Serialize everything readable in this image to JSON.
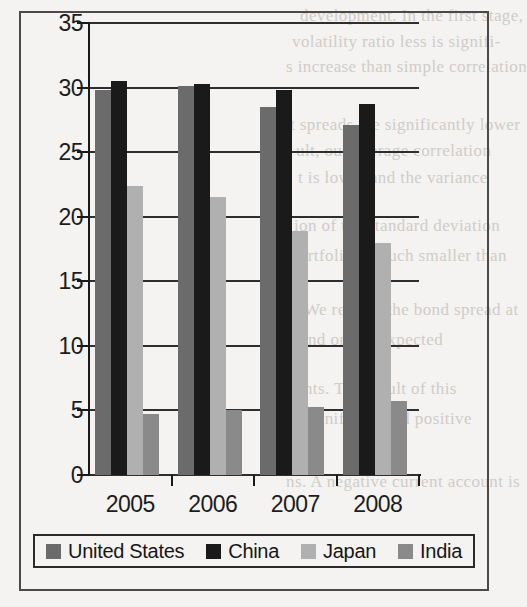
{
  "chart_data": {
    "type": "bar",
    "title": "",
    "subtitle": "",
    "xlabel": "",
    "ylabel": "",
    "categories": [
      "2005",
      "2006",
      "2007",
      "2008"
    ],
    "series": [
      {
        "name": "United States",
        "color": "#6b6b6b",
        "values": [
          29.8,
          30.1,
          28.5,
          27.1
        ]
      },
      {
        "name": "China",
        "color": "#1a1a1a",
        "values": [
          30.5,
          30.3,
          29.8,
          28.7
        ]
      },
      {
        "name": "Japan",
        "color": "#b0b0b0",
        "values": [
          22.4,
          21.5,
          18.9,
          18.0
        ]
      },
      {
        "name": "India",
        "color": "#8a8a8a",
        "values": [
          4.7,
          5.0,
          5.3,
          5.7
        ]
      }
    ],
    "ylim": [
      0,
      35
    ],
    "yticks": [
      0,
      5,
      10,
      15,
      20,
      25,
      30,
      35
    ],
    "ytick_labels": [
      "0",
      "5",
      "10",
      "15",
      "20",
      "25",
      "30",
      "35"
    ],
    "grid": true,
    "grid_axis": "y",
    "legend_position": "bottom",
    "orientation": "vertical",
    "grouping": "clustered"
  },
  "ghost_text": [
    {
      "text": "development. In the first stage,",
      "x": 300,
      "y": 6
    },
    {
      "text": "volatility ratio less is signifi-",
      "x": 292,
      "y": 32
    },
    {
      "text": "s increase than simple correlation",
      "x": 286,
      "y": 57
    },
    {
      "text": "t spreads are significantly lower",
      "x": 290,
      "y": 115
    },
    {
      "text": "ult, our average correlation",
      "x": 296,
      "y": 141
    },
    {
      "text": "t is lower and the variance",
      "x": 298,
      "y": 168
    },
    {
      "text": "ion of the standard deviation",
      "x": 294,
      "y": 216
    },
    {
      "text": "portfolio is much smaller than",
      "x": 290,
      "y": 246
    },
    {
      "text": "d. We regress the bond spread at",
      "x": 286,
      "y": 300
    },
    {
      "text": "and on the expected",
      "x": 300,
      "y": 330
    },
    {
      "text": "ents. The result of this",
      "x": 296,
      "y": 379
    },
    {
      "text": "s significant and positive",
      "x": 292,
      "y": 409
    },
    {
      "text": "ns. A negative current account is",
      "x": 286,
      "y": 472
    }
  ]
}
